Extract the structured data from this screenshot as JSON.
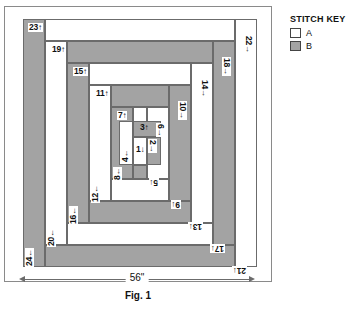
{
  "figure": {
    "caption": "Fig. 1",
    "width_dimension": "56\"",
    "colors": {
      "fabric_a": "#ffffff",
      "fabric_b": "#a3a3a3",
      "outline": "#6b6b6b"
    }
  },
  "stitch_key": {
    "title": "STITCH KEY",
    "entries": [
      {
        "label": "A",
        "swatch": "fabric-a-white"
      },
      {
        "label": "B",
        "swatch": "fabric-b-gray"
      }
    ]
  },
  "strips": [
    {
      "n": "1",
      "arrow": "↓",
      "fabric": "A",
      "rotation": 0
    },
    {
      "n": "2",
      "arrow": "→",
      "fabric": "B",
      "rotation": 90
    },
    {
      "n": "3",
      "arrow": "↑",
      "fabric": "B",
      "rotation": 0
    },
    {
      "n": "4",
      "arrow": "←",
      "fabric": "A",
      "rotation": 90
    },
    {
      "n": "5",
      "arrow": "↓",
      "fabric": "B",
      "rotation": 180
    },
    {
      "n": "6",
      "arrow": "→",
      "fabric": "A",
      "rotation": 90
    },
    {
      "n": "7",
      "arrow": "↑",
      "fabric": "A",
      "rotation": 0
    },
    {
      "n": "8",
      "arrow": "←",
      "fabric": "B",
      "rotation": 90
    },
    {
      "n": "9",
      "arrow": "↓",
      "fabric": "A",
      "rotation": 180
    },
    {
      "n": "10",
      "arrow": "→",
      "fabric": "B",
      "rotation": 90
    },
    {
      "n": "11",
      "arrow": "↑",
      "fabric": "B",
      "rotation": 0
    },
    {
      "n": "12",
      "arrow": "←",
      "fabric": "A",
      "rotation": 90
    },
    {
      "n": "13",
      "arrow": "↓",
      "fabric": "B",
      "rotation": 180
    },
    {
      "n": "14",
      "arrow": "→",
      "fabric": "A",
      "rotation": 90
    },
    {
      "n": "15",
      "arrow": "↑",
      "fabric": "A",
      "rotation": 0
    },
    {
      "n": "16",
      "arrow": "←",
      "fabric": "B",
      "rotation": 90
    },
    {
      "n": "17",
      "arrow": "↓",
      "fabric": "A",
      "rotation": 180
    },
    {
      "n": "18",
      "arrow": "→",
      "fabric": "B",
      "rotation": 90
    },
    {
      "n": "19",
      "arrow": "↑",
      "fabric": "B",
      "rotation": 0
    },
    {
      "n": "20",
      "arrow": "←",
      "fabric": "A",
      "rotation": 90
    },
    {
      "n": "21",
      "arrow": "↓",
      "fabric": "B",
      "rotation": 180
    },
    {
      "n": "22",
      "arrow": "→",
      "fabric": "A",
      "rotation": 90
    },
    {
      "n": "23",
      "arrow": "↑",
      "fabric": "A",
      "rotation": 0
    },
    {
      "n": "24",
      "arrow": "←",
      "fabric": "B",
      "rotation": 90
    }
  ]
}
